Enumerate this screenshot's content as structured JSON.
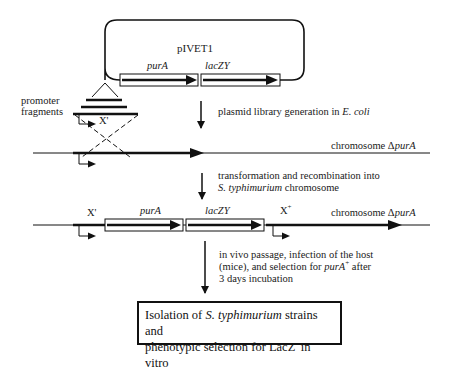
{
  "plasmid": {
    "name": "pIVET1",
    "genes": [
      "purA",
      "lacZY"
    ]
  },
  "labels": {
    "promoter_fragments_line1": "promoter",
    "promoter_fragments_line2": "fragments",
    "x_prime": "X'",
    "x_plus": "X",
    "x_plus_sup": "+",
    "chromosome_prefix": "chromosome Δ",
    "chromosome_gene": "purA"
  },
  "steps": [
    {
      "pre": "plasmid library generation in ",
      "italic": "E. coli"
    },
    {
      "line1": "transformation and recombination into",
      "line2_italic": "S. typhimurium",
      "line2_rest": " chromosome"
    },
    {
      "line1": "in vivo passage, infection of the host",
      "line2_pre": "(mice), and selection for ",
      "line2_italic": "purA",
      "line2_sup": "+",
      "line2_post": " after",
      "line3": "3 days incubation"
    }
  ],
  "final_box": {
    "line1_pre": "Isolation of ",
    "line1_italic": "S. typhimurium",
    "line1_post": " strains and",
    "line2_pre": "phenotypic selection for LacZ",
    "line2_sup": "-",
    "line2_post": " in vitro"
  }
}
